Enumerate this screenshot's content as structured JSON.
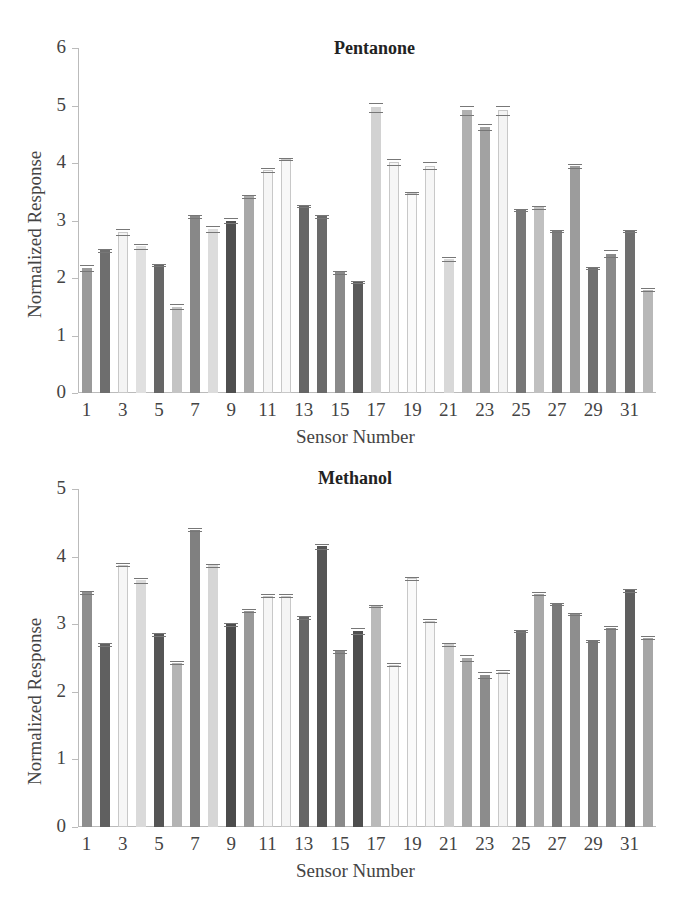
{
  "chart_data": [
    {
      "type": "bar",
      "title": "Pentanone",
      "xlabel": "Sensor Number",
      "ylabel": "Normalized Response",
      "ylim": [
        0,
        6
      ],
      "yticks": [
        0,
        1,
        2,
        3,
        4,
        5,
        6
      ],
      "xtick_labels": [
        "1",
        "3",
        "5",
        "7",
        "9",
        "11",
        "13",
        "15",
        "17",
        "19",
        "21",
        "23",
        "25",
        "27",
        "29",
        "31"
      ],
      "grid": false,
      "legend": null,
      "categories": [
        1,
        2,
        3,
        4,
        5,
        6,
        7,
        8,
        9,
        10,
        11,
        12,
        13,
        14,
        15,
        16,
        17,
        18,
        19,
        20,
        21,
        22,
        23,
        24,
        25,
        26,
        27,
        28,
        29,
        30,
        31,
        32
      ],
      "values": [
        2.18,
        2.48,
        2.8,
        2.55,
        2.23,
        1.5,
        3.07,
        2.85,
        3.0,
        3.42,
        3.88,
        4.07,
        3.25,
        3.07,
        2.1,
        1.93,
        4.97,
        4.02,
        3.48,
        3.95,
        2.33,
        4.92,
        4.63,
        4.92,
        3.18,
        3.23,
        2.82,
        3.95,
        2.17,
        2.42,
        2.82,
        1.8
      ],
      "error": [
        0.05,
        0.02,
        0.05,
        0.05,
        0.02,
        0.04,
        0.02,
        0.05,
        0.04,
        0.02,
        0.04,
        0.02,
        0.02,
        0.02,
        0.03,
        0.02,
        0.08,
        0.05,
        0.02,
        0.06,
        0.04,
        0.08,
        0.05,
        0.08,
        0.02,
        0.03,
        0.02,
        0.04,
        0.02,
        0.06,
        0.02,
        0.03
      ],
      "shades": [
        "#9a9a9a",
        "#6e6e6e",
        "#f4f4f4",
        "#e0e0e0",
        "#666666",
        "#c4c4c4",
        "#888888",
        "#dcdcdc",
        "#4f4f4f",
        "#a8a8a8",
        "#f6f6f6",
        "#f8f8f8",
        "#666666",
        "#6a6a6a",
        "#8a8a8a",
        "#5a5a5a",
        "#d2d2d2",
        "#f6f6f6",
        "#fafafa",
        "#f6f6f6",
        "#d8d8d8",
        "#b0b0b0",
        "#a2a2a2",
        "#f4f4f4",
        "#777777",
        "#c0c0c0",
        "#7c7c7c",
        "#9c9c9c",
        "#707070",
        "#8a8a8a",
        "#6e6e6e",
        "#b8b8b8"
      ]
    },
    {
      "type": "bar",
      "title": "Methanol",
      "xlabel": "Sensor Number",
      "ylabel": "Normalized Response",
      "ylim": [
        0,
        5
      ],
      "yticks": [
        0,
        1,
        2,
        3,
        4,
        5
      ],
      "xtick_labels": [
        "1",
        "3",
        "5",
        "7",
        "9",
        "11",
        "13",
        "15",
        "17",
        "19",
        "21",
        "23",
        "25",
        "27",
        "29",
        "31"
      ],
      "grid": false,
      "legend": null,
      "categories": [
        1,
        2,
        3,
        4,
        5,
        6,
        7,
        8,
        9,
        10,
        11,
        12,
        13,
        14,
        15,
        16,
        17,
        18,
        19,
        20,
        21,
        22,
        23,
        24,
        25,
        26,
        27,
        28,
        29,
        30,
        31,
        32
      ],
      "values": [
        3.47,
        2.7,
        3.88,
        3.65,
        2.85,
        2.43,
        4.4,
        3.87,
        3.0,
        3.2,
        3.42,
        3.42,
        3.1,
        4.15,
        2.6,
        2.9,
        3.27,
        2.4,
        3.68,
        3.05,
        2.7,
        2.5,
        2.25,
        2.3,
        2.9,
        3.45,
        3.3,
        3.15,
        2.75,
        2.95,
        3.5,
        2.8
      ],
      "error": [
        0.02,
        0.02,
        0.02,
        0.04,
        0.02,
        0.02,
        0.02,
        0.02,
        0.02,
        0.02,
        0.02,
        0.02,
        0.02,
        0.04,
        0.02,
        0.04,
        0.02,
        0.02,
        0.02,
        0.02,
        0.02,
        0.04,
        0.05,
        0.02,
        0.02,
        0.02,
        0.02,
        0.02,
        0.02,
        0.02,
        0.02,
        0.02
      ],
      "shades": [
        "#8e8e8e",
        "#606060",
        "#f6f6f6",
        "#dadada",
        "#555555",
        "#b4b4b4",
        "#808080",
        "#d6d6d6",
        "#4c4c4c",
        "#999999",
        "#f6f6f6",
        "#f4f4f4",
        "#666666",
        "#555555",
        "#8a8a8a",
        "#4e4e4e",
        "#bababa",
        "#f8f8f8",
        "#fafafa",
        "#f6f6f6",
        "#cccccc",
        "#a8a8a8",
        "#8c8c8c",
        "#f4f4f4",
        "#6e6e6e",
        "#a8a8a8",
        "#7a7a7a",
        "#8e8e8e",
        "#787878",
        "#8a8a8a",
        "#5e5e5e",
        "#a6a6a6"
      ]
    }
  ]
}
